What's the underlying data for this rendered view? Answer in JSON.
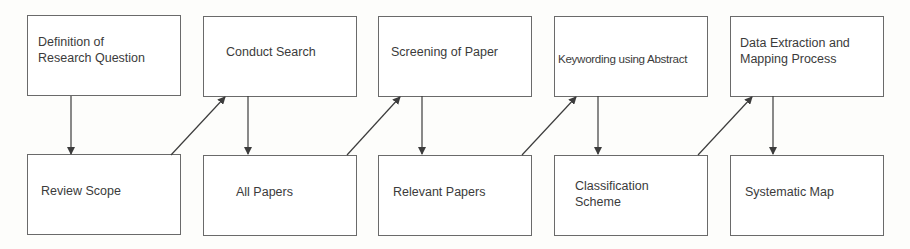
{
  "diagram": {
    "colors": {
      "box_border": "#6a6a6a",
      "arrow": "#3c3c3c",
      "text": "#3b3b3b",
      "background": "#fdfdfb"
    },
    "process_steps": [
      {
        "id": "step1",
        "label": "Definition of\nResearch Question"
      },
      {
        "id": "step2",
        "label": "Conduct Search"
      },
      {
        "id": "step3",
        "label": "Screening of Paper"
      },
      {
        "id": "step4",
        "label": "Keywording using Abstract"
      },
      {
        "id": "step5",
        "label": "Data Extraction and\nMapping Process"
      }
    ],
    "outcomes": [
      {
        "id": "out1",
        "label": "Review Scope"
      },
      {
        "id": "out2",
        "label": "All Papers"
      },
      {
        "id": "out3",
        "label": "Relevant Papers"
      },
      {
        "id": "out4",
        "label": "Classification\nScheme"
      },
      {
        "id": "out5",
        "label": "Systematic Map"
      }
    ],
    "edges": [
      {
        "from": "step1",
        "to": "out1",
        "kind": "produces"
      },
      {
        "from": "out1",
        "to": "step2",
        "kind": "feeds"
      },
      {
        "from": "step2",
        "to": "out2",
        "kind": "produces"
      },
      {
        "from": "out2",
        "to": "step3",
        "kind": "feeds"
      },
      {
        "from": "step3",
        "to": "out3",
        "kind": "produces"
      },
      {
        "from": "out3",
        "to": "step4",
        "kind": "feeds"
      },
      {
        "from": "step4",
        "to": "out4",
        "kind": "produces"
      },
      {
        "from": "out4",
        "to": "step5",
        "kind": "feeds"
      },
      {
        "from": "step5",
        "to": "out5",
        "kind": "produces"
      }
    ]
  }
}
